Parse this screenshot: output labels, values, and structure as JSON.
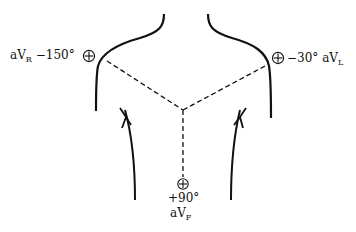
{
  "diagram": {
    "type": "augmented limb lead placement (torso outline)",
    "leads": [
      {
        "id": "aVR",
        "prefix": "aV",
        "subscript": "R",
        "angle": "−150°",
        "polarity_icon": "⊕"
      },
      {
        "id": "aVL",
        "prefix": "aV",
        "subscript": "L",
        "angle": "−30°",
        "polarity_icon": "⊕"
      },
      {
        "id": "aVF",
        "prefix": "aV",
        "subscript": "F",
        "angle": "+90°",
        "polarity_icon": "⊕"
      }
    ],
    "colors": {
      "line": "#111111",
      "background": "#ffffff"
    }
  }
}
